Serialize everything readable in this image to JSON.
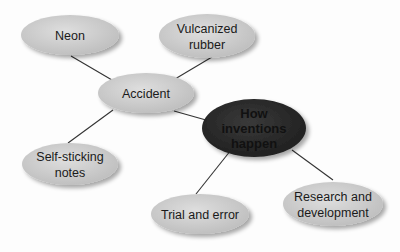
{
  "diagram": {
    "type": "concept-map",
    "colors": {
      "node_fill": "#c9c9c9",
      "node_fill_light": "#dcdcdc",
      "center_fill": "#2b2b2b",
      "center_text": "#0d0d0d",
      "edge": "#333333",
      "shadow": "#9a9a9a"
    },
    "nodes": [
      {
        "id": "neon",
        "lines": [
          "Neon"
        ],
        "cx": 70,
        "cy": 35,
        "rx": 49,
        "ry": 20
      },
      {
        "id": "vulcanized-rubber",
        "lines": [
          "Vulcanized",
          "rubber"
        ],
        "cx": 207,
        "cy": 36,
        "rx": 48,
        "ry": 22
      },
      {
        "id": "accident",
        "lines": [
          "Accident"
        ],
        "cx": 146,
        "cy": 93,
        "rx": 48,
        "ry": 20
      },
      {
        "id": "how-inventions-happen",
        "lines": [
          "How",
          "inventions",
          "happen"
        ],
        "cx": 254,
        "cy": 128,
        "rx": 52,
        "ry": 29,
        "center": true
      },
      {
        "id": "self-sticking-notes",
        "lines": [
          "Self-sticking",
          "notes"
        ],
        "cx": 70,
        "cy": 164,
        "rx": 48,
        "ry": 21
      },
      {
        "id": "trial-and-error",
        "lines": [
          "Trial and error"
        ],
        "cx": 200,
        "cy": 214,
        "rx": 49,
        "ry": 20
      },
      {
        "id": "research-and-development",
        "lines": [
          "Research and",
          "development"
        ],
        "cx": 333,
        "cy": 204,
        "rx": 50,
        "ry": 22
      }
    ],
    "edges": [
      {
        "from": "neon",
        "to": "accident",
        "x1": 71,
        "y1": 56,
        "x2": 112,
        "y2": 80
      },
      {
        "from": "vulcanized-rubber",
        "to": "accident",
        "x1": 212,
        "y1": 57,
        "x2": 175,
        "y2": 79
      },
      {
        "from": "accident",
        "to": "self-sticking-notes",
        "x1": 113,
        "y1": 110,
        "x2": 68,
        "y2": 143
      },
      {
        "from": "accident",
        "to": "how-inventions-happen",
        "x1": 174,
        "y1": 111,
        "x2": 213,
        "y2": 122
      },
      {
        "from": "how-inventions-happen",
        "to": "trial-and-error",
        "x1": 231,
        "y1": 150,
        "x2": 196,
        "y2": 194
      },
      {
        "from": "how-inventions-happen",
        "to": "research-and-development",
        "x1": 292,
        "y1": 150,
        "x2": 333,
        "y2": 180
      }
    ]
  }
}
